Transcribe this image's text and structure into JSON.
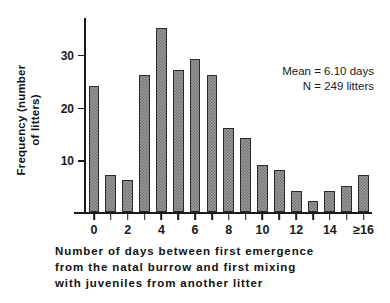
{
  "chart_data": {
    "type": "bar",
    "title": "",
    "xlabel": "Number of days between first emergence from the natal burrow and first mixing with juveniles from another litter",
    "ylabel": "Frequency (number of litters)",
    "categories": [
      "0",
      "1",
      "2",
      "3",
      "4",
      "5",
      "6",
      "7",
      "8",
      "9",
      "10",
      "11",
      "12",
      "13",
      "14",
      "15",
      "≥16"
    ],
    "values": [
      24,
      7,
      6,
      26,
      35,
      27,
      29,
      26,
      16,
      14,
      9,
      8,
      4,
      2,
      4,
      5,
      7
    ],
    "ylim": [
      0,
      37
    ],
    "yticks": [
      10,
      20,
      30
    ],
    "ytick_labels": [
      "10",
      "20",
      "30"
    ],
    "xtick_positions": [
      0,
      2,
      4,
      6,
      8,
      10,
      12,
      14,
      16
    ],
    "xtick_labels": [
      "0",
      "2",
      "4",
      "6",
      "8",
      "10",
      "12",
      "14",
      "≥16"
    ],
    "grid": false,
    "legend": false,
    "bar_color": "#8a8a8a",
    "bar_edge_color": "#2a2a2a",
    "axis_color": "#1a1a1a",
    "annotations": [
      "Mean = 6.10 days",
      "N = 249 litters"
    ]
  },
  "yaxis": {
    "title_lines": [
      "Frequency (number",
      "of  litters)"
    ]
  },
  "xaxis": {
    "caption_lines": [
      "Number  of  days  between  first  emergence",
      "from  the  natal  burrow  and  first  mixing",
      "with  juveniles  from  another  litter"
    ]
  },
  "annotation": {
    "mean_line": "Mean = 6.10 days",
    "n_line": "N = 249 litters"
  }
}
